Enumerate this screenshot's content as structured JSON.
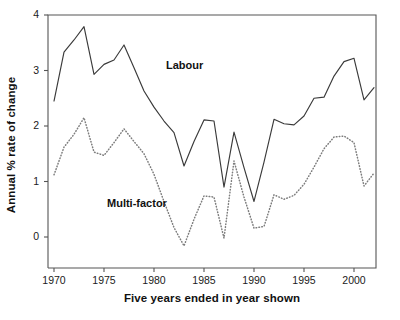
{
  "chart_data": {
    "type": "line",
    "title": "",
    "xlabel": "Five years ended in year shown",
    "ylabel": "Annual % rate of change",
    "xlim": [
      1969.4,
      2002.2
    ],
    "ylim": [
      -0.45,
      4.0
    ],
    "xticks": [
      1970,
      1975,
      1980,
      1985,
      1990,
      1995,
      2000
    ],
    "yticks": [
      0,
      1,
      2,
      3,
      4
    ],
    "xtick_labels": [
      "1970",
      "1975",
      "1980",
      "1985",
      "1990",
      "1995",
      "2000"
    ],
    "ytick_labels": [
      "0",
      "1",
      "2",
      "3",
      "4"
    ],
    "grid": false,
    "legend_position": "inline-annotations",
    "annotations": [
      {
        "text": "Labour",
        "x": 1981.2,
        "y": 3.08
      },
      {
        "text": "Multi-factor",
        "x": 1975.3,
        "y": 0.6
      }
    ],
    "x": [
      1970,
      1971,
      1972,
      1973,
      1974,
      1975,
      1976,
      1977,
      1978,
      1979,
      1980,
      1981,
      1982,
      1983,
      1984,
      1985,
      1986,
      1987,
      1988,
      1989,
      1990,
      1991,
      1992,
      1993,
      1994,
      1995,
      1996,
      1997,
      1998,
      1999,
      2000,
      2001,
      2002
    ],
    "series": [
      {
        "name": "Labour",
        "style": "solid",
        "color": "#3a3a3a",
        "values": [
          2.45,
          3.33,
          3.55,
          3.79,
          2.93,
          3.11,
          3.19,
          3.46,
          3.05,
          2.63,
          2.34,
          2.09,
          1.88,
          1.28,
          1.72,
          2.11,
          2.09,
          0.9,
          1.89,
          1.25,
          0.64,
          1.35,
          2.12,
          2.04,
          2.02,
          2.18,
          2.5,
          2.52,
          2.9,
          3.16,
          3.22,
          2.47,
          2.69
        ]
      },
      {
        "name": "Multi-factor",
        "style": "dotted",
        "color": "#7d7d7d",
        "values": [
          1.12,
          1.62,
          1.85,
          2.15,
          1.53,
          1.47,
          1.7,
          1.95,
          1.72,
          1.5,
          1.13,
          0.64,
          0.17,
          -0.16,
          0.32,
          0.74,
          0.72,
          -0.02,
          1.37,
          0.72,
          0.16,
          0.19,
          0.76,
          0.68,
          0.75,
          0.95,
          1.26,
          1.59,
          1.8,
          1.82,
          1.7,
          0.92,
          1.15
        ]
      }
    ]
  }
}
